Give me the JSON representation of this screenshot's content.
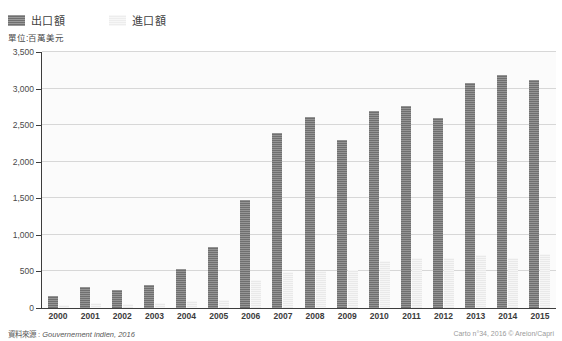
{
  "legend": {
    "items": [
      {
        "label": "出口額",
        "swatch": "export-swatch",
        "color": "#6f6f6f"
      },
      {
        "label": "進口額",
        "swatch": "import-swatch",
        "color": "#e9e9e9"
      }
    ]
  },
  "unit_caption": "單位:百萬美元",
  "footer": {
    "source_label": "資料來源 :",
    "source_value": "Gouvernement indien, 2016",
    "credit": "Carto n°34, 2016 © Areion/Capri"
  },
  "chart_data": {
    "type": "bar",
    "title": "",
    "subtitle": "",
    "xlabel": "",
    "ylabel": "單位:百萬美元",
    "ylim": [
      0,
      3500
    ],
    "ytick_step": 500,
    "yticks": [
      0,
      500,
      1000,
      1500,
      2000,
      2500,
      3000,
      3500
    ],
    "ytick_labels": [
      "0",
      "500",
      "1,000",
      "1,500",
      "2,000",
      "2,500",
      "3,000",
      "3,500"
    ],
    "grid": true,
    "grid_axis": "y",
    "legend_position": "top-left",
    "categories": [
      "2000",
      "2001",
      "2002",
      "2003",
      "2004",
      "2005",
      "2006",
      "2007",
      "2008",
      "2009",
      "2010",
      "2011",
      "2012",
      "2013",
      "2014",
      "2015"
    ],
    "series": [
      {
        "name": "出口額",
        "color": "#6f6f6f",
        "values": [
          165,
          285,
          245,
          310,
          540,
          830,
          1470,
          2390,
          2610,
          2300,
          2700,
          2760,
          2600,
          3080,
          3180,
          3120
        ]
      },
      {
        "name": "進口額",
        "color": "#e9e9e9",
        "values": [
          45,
          70,
          60,
          75,
          90,
          110,
          380,
          490,
          510,
          520,
          640,
          680,
          690,
          720,
          690,
          740
        ]
      }
    ]
  }
}
